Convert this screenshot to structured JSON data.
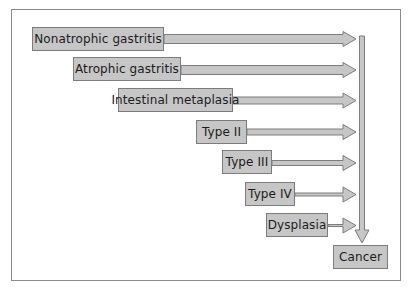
{
  "diagram": {
    "stages": [
      {
        "label": "Nonatrophic gastritis"
      },
      {
        "label": "Atrophic gastritis"
      },
      {
        "label": "Intestinal metaplasia"
      },
      {
        "label": "Type II"
      },
      {
        "label": "Type III"
      },
      {
        "label": "Type IV"
      },
      {
        "label": "Dysplasia"
      }
    ],
    "outcome": {
      "label": "Cancer"
    },
    "colors": {
      "box_fill": "#c6c6c6",
      "box_border": "#7c7c7c",
      "arrow_fill": "#c6c6c6",
      "arrow_stroke": "#7c7c7c",
      "frame_border": "#8a8a8a",
      "text": "#1c1c1c"
    }
  }
}
